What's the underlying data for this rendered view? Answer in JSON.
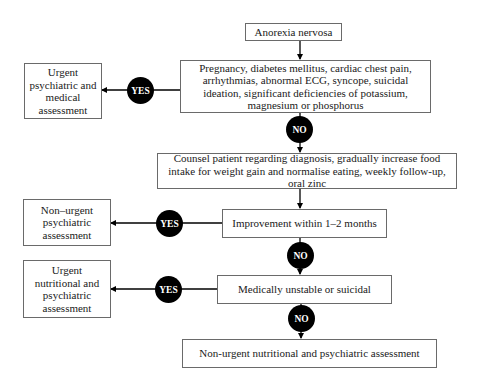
{
  "flowchart": {
    "start": "Anorexia nervosa",
    "step1": {
      "question": "Pregnancy, diabetes mellitus, cardiac chest pain, arrhythmias, abnormal ECG, syncope, suicidal ideation, significant deficiencies of potassium, magnesium or phosphorus",
      "yes_label": "YES",
      "no_label": "NO",
      "yes_outcome": "Urgent psychiatric and medical assessment"
    },
    "step2": {
      "action": "Counsel patient regarding diagnosis, gradually increase food intake for weight gain and normalise eating, weekly follow-up, oral zinc"
    },
    "step3": {
      "question": "Improvement within 1–2 months",
      "yes_label": "YES",
      "no_label": "NO",
      "yes_outcome": "Non–urgent psychiatric assessment"
    },
    "step4": {
      "question": "Medically unstable or suicidal",
      "yes_label": "YES",
      "no_label": "NO",
      "yes_outcome": "Urgent nutritional and psychiatric assessment"
    },
    "end": "Non-urgent nutritional and psychiatric assessment"
  }
}
